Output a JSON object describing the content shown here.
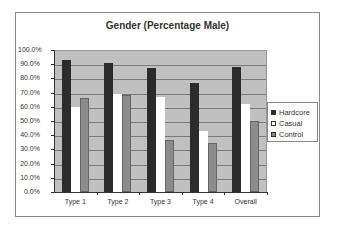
{
  "chart_data": {
    "type": "bar",
    "title": "Gender (Percentage Male)",
    "xlabel": "",
    "ylabel": "",
    "categories": [
      "Type 1",
      "Type 2",
      "Type 3",
      "Type 4",
      "Overall"
    ],
    "series": [
      {
        "name": "Hardcore",
        "color": "#2b2b2b",
        "values": [
          93,
          91,
          87.5,
          76.5,
          88
        ]
      },
      {
        "name": "Casual",
        "color": "#ffffff",
        "values": [
          60,
          69,
          67,
          43,
          62
        ]
      },
      {
        "name": "Control",
        "color": "#8c8c8c",
        "values": [
          66.5,
          68,
          36.5,
          34.5,
          50
        ]
      }
    ],
    "ylim": [
      0,
      100
    ],
    "yticks": [
      "0.0%",
      "10.0%",
      "20.0%",
      "30.0%",
      "40.0%",
      "50.0%",
      "60.0%",
      "70.0%",
      "80.0%",
      "90.0%",
      "100.0%"
    ],
    "grid": true,
    "legend_position": "right",
    "plot_background": "#c0c0c0"
  },
  "legend": {
    "items": [
      {
        "label": "Hardcore",
        "color": "#2b2b2b"
      },
      {
        "label": "Casual",
        "color": "#ffffff"
      },
      {
        "label": "Control",
        "color": "#8c8c8c"
      }
    ]
  }
}
